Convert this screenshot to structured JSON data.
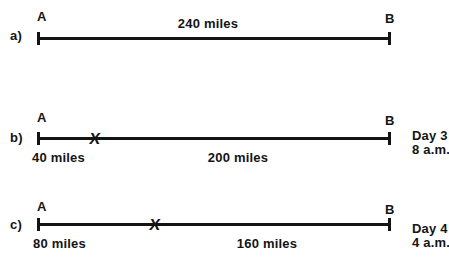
{
  "diagram": {
    "background_color": "#ffffff",
    "ink_color": "#141414",
    "rows": [
      {
        "label": "a)",
        "start_point": "A",
        "end_point": "B",
        "total_distance": "240 miles"
      },
      {
        "label": "b)",
        "start_point": "A",
        "end_point": "B",
        "marker": "X",
        "distance_before_marker": "40 miles",
        "distance_after_marker": "200 miles",
        "note_day": "Day 3",
        "note_time": "8 a.m."
      },
      {
        "label": "c)",
        "start_point": "A",
        "end_point": "B",
        "marker": "X",
        "distance_before_marker": "80 miles",
        "distance_after_marker": "160 miles",
        "note_day": "Day 4",
        "note_time": "4 a.m."
      }
    ]
  }
}
